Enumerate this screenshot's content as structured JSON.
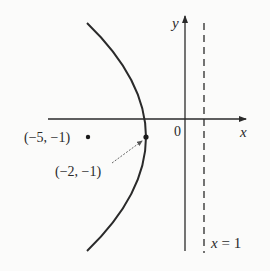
{
  "diagram": {
    "type": "parabola",
    "equation": "(y+1)^2 = -12(x+2)",
    "axes": {
      "x_label": "x",
      "y_label": "y",
      "origin_label": "0"
    },
    "directrix": {
      "label": "x = 1",
      "label_var": "x",
      "label_rest": " = 1",
      "x": 1,
      "style": "dashed"
    },
    "focus": {
      "label": "(−5, −1)",
      "x": -5,
      "y": -1
    },
    "vertex": {
      "label": "(−2, −1)",
      "x": -2,
      "y": -1
    },
    "colors": {
      "ink": "#2a2a2a",
      "background": "#fbfbfa"
    }
  }
}
